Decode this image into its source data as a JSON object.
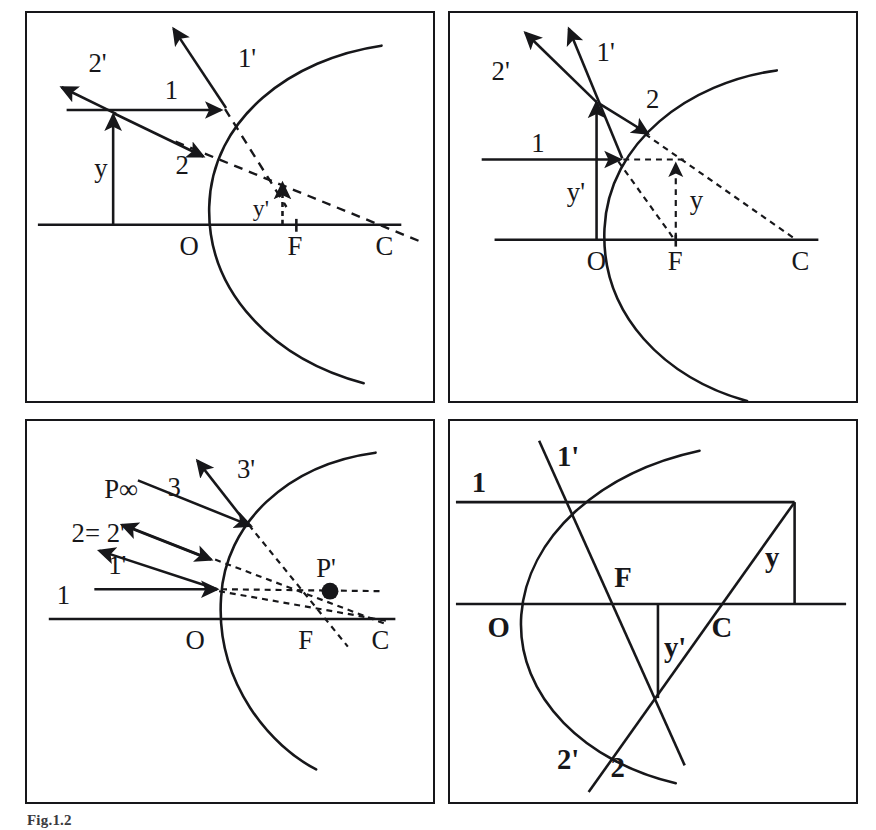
{
  "figure": {
    "caption": "Fig.1.2",
    "ink_color": "#17171a",
    "background": "#ffffff"
  },
  "panels": [
    {
      "id": "a",
      "position": "top-left",
      "description": "Convex mirror, object outside focus: ray 1 parallel to axis and ray 2 toward centre of curvature, reflected rays 1' and 2' diverge; virtual image y' formed between O and F.",
      "labels": {
        "ray1": "1",
        "ray1_reflected": "1'",
        "ray2": "2",
        "ray2_reflected": "2'",
        "object_height": "y",
        "image_height": "y'",
        "vertex": "O",
        "focus": "F",
        "centre": "C"
      }
    },
    {
      "id": "b",
      "position": "top-right",
      "description": "Convex mirror, object inside focus: tall object y' at the mirror, ray 1 parallel to axis and ray 2 aimed at C, reflected rays 1' and 2' diverge; reduced virtual image y near F.",
      "labels": {
        "ray1": "1",
        "ray1_reflected": "1'",
        "ray2": "2",
        "ray2_reflected": "2'",
        "object_height": "y'",
        "image_height": "y",
        "vertex": "O",
        "focus": "F",
        "centre": "C"
      }
    },
    {
      "id": "c",
      "position": "bottom-left",
      "description": "Convex mirror with object at infinity: incident rays 1, 2 and 3 reflect as 1', 2'=2 and 3'; the backward extensions of the reflected rays meet at the virtual image point P'.",
      "labels": {
        "ray1": "1",
        "ray1_reflected": "1'",
        "ray2_equals": "2= 2'",
        "ray3": "3",
        "ray3_reflected": "3'",
        "object_at_infinity": "P∞",
        "image_point": "P'",
        "vertex": "O",
        "focus": "F",
        "centre": "C"
      }
    },
    {
      "id": "d",
      "position": "bottom-right",
      "description": "Convex mirror construction with bold labels: incident ray 1 parallel to axis and ray 2 through the mirror, with reflected rays 1' and 2'; object height y at the right, image height y' below the axis.",
      "labels": {
        "ray1": "1",
        "ray1_reflected": "1'",
        "ray2": "2",
        "ray2_reflected": "2'",
        "object_height": "y",
        "image_height": "y'",
        "vertex": "O",
        "focus": "F",
        "centre": "C"
      }
    }
  ]
}
